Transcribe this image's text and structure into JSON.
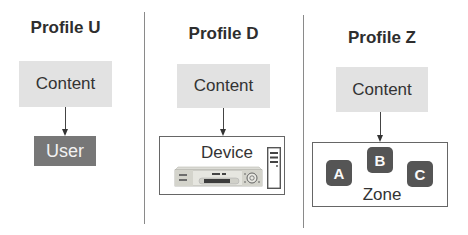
{
  "panels": [
    {
      "title": "Profile U",
      "source_label": "Content",
      "target": {
        "type": "box",
        "label": "User"
      }
    },
    {
      "title": "Profile D",
      "source_label": "Content",
      "target": {
        "type": "device",
        "label": "Device",
        "icons": [
          "dvd-player-icon",
          "tower-computer-icon"
        ]
      }
    },
    {
      "title": "Profile Z",
      "source_label": "Content",
      "target": {
        "type": "zone",
        "label": "Zone",
        "members": [
          "A",
          "B",
          "C"
        ]
      }
    }
  ],
  "colors": {
    "content_fill": "#e2e2e2",
    "user_fill": "#777777",
    "zone_member_fill": "#555555",
    "divider": "#8a8a8a",
    "text": "#333333"
  }
}
